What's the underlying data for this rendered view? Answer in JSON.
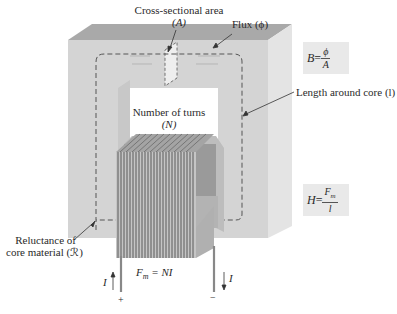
{
  "diagram": {
    "colors": {
      "core_front": "#d6d6d6",
      "core_top": "#a9a9a9",
      "core_side": "#e6e6e6",
      "window": "#ffffff",
      "coil": "#8a8a8a",
      "dashed_path": "#555555",
      "equation_box": "#e9e9e9"
    },
    "labels": {
      "cross_section_line1": "Cross-sectional area",
      "cross_section_line2": "(A)",
      "flux": "Flux (ϕ)",
      "length": "Length around core (l)",
      "turns_line1": "Number of turns",
      "turns_line2": "(N)",
      "reluctance_line1": "Reluctance of",
      "reluctance_line2": "core material (ℛ)",
      "mmf": "Fm = NI",
      "mmf_lhs": "F",
      "mmf_sub": "m",
      "mmf_rhs": " = NI",
      "current_left": "I",
      "current_right": "I",
      "plus": "+",
      "minus": "−"
    },
    "equations": {
      "B": {
        "lhs": "B",
        "eq": " = ",
        "num": "ϕ",
        "den": "A"
      },
      "H": {
        "lhs": "H",
        "eq": " = ",
        "num": "Fm",
        "num_base": "F",
        "num_sub": "m",
        "den": "l"
      }
    }
  }
}
